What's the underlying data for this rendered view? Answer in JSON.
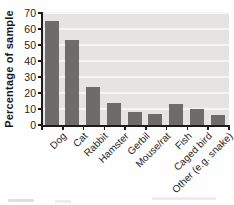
{
  "chart_data": {
    "type": "bar",
    "title": "",
    "xlabel": "",
    "ylabel": "Percentage of sample",
    "categories": [
      "Dog",
      "Cat",
      "Rabbit",
      "Hamster",
      "Gerbil",
      "Mouse/rat",
      "Fish",
      "Caged bird",
      "Other (e.g. snake)"
    ],
    "values": [
      65,
      53,
      24,
      14,
      8,
      7,
      13,
      10,
      6
    ],
    "ylim": [
      0,
      70
    ],
    "yticks": [
      0,
      10,
      20,
      30,
      40,
      50,
      60,
      70
    ],
    "grid": "horizontal white lines on shaded plot background",
    "legend": "none",
    "colors": {
      "bar": "#6e6c6a",
      "plot_background": "#e6e4e2",
      "gridline": "#f6f5f3",
      "axis": "#1c1c1c",
      "page_background": "#fefefe"
    }
  }
}
